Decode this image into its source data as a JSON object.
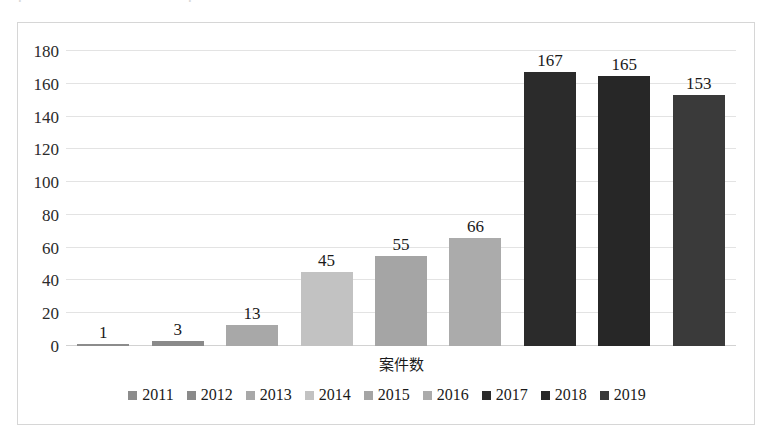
{
  "scan_artifact": {
    "text": "ー ． ・ ・ ・ ・ 一 ・ ・ ・ ・ ． ・ ・ ・ ・ ・"
  },
  "chart_data": {
    "type": "bar",
    "title": "",
    "subtitle": "",
    "xlabel": "案件数",
    "ylabel": "",
    "ylim": [
      0,
      180
    ],
    "ytick_step": 20,
    "yticks": [
      "180",
      "160",
      "140",
      "120",
      "100",
      "80",
      "60",
      "40",
      "20",
      "0"
    ],
    "grid": true,
    "legend_position": "bottom",
    "categories": [
      "2011",
      "2012",
      "2013",
      "2014",
      "2015",
      "2016",
      "2017",
      "2018",
      "2019"
    ],
    "values": [
      1,
      3,
      13,
      45,
      55,
      66,
      167,
      165,
      153
    ],
    "data_labels": [
      "1",
      "3",
      "13",
      "45",
      "55",
      "66",
      "167",
      "165",
      "153"
    ],
    "colors": [
      "#8c8c8c",
      "#8a8a8a",
      "#a8a8a8",
      "#c2c2c2",
      "#a5a5a5",
      "#ababab",
      "#2b2b2b",
      "#272727",
      "#3a3a3a"
    ],
    "series": [
      {
        "name": "2011",
        "value": 1,
        "color": "#8c8c8c"
      },
      {
        "name": "2012",
        "value": 3,
        "color": "#8a8a8a"
      },
      {
        "name": "2013",
        "value": 13,
        "color": "#a8a8a8"
      },
      {
        "name": "2014",
        "value": 45,
        "color": "#c2c2c2"
      },
      {
        "name": "2015",
        "value": 55,
        "color": "#a5a5a5"
      },
      {
        "name": "2016",
        "value": 66,
        "color": "#ababab"
      },
      {
        "name": "2017",
        "value": 167,
        "color": "#2b2b2b"
      },
      {
        "name": "2018",
        "value": 165,
        "color": "#272727"
      },
      {
        "name": "2019",
        "value": 153,
        "color": "#3a3a3a"
      }
    ]
  },
  "legend": {
    "items": [
      {
        "label": "2011",
        "color": "#8c8c8c"
      },
      {
        "label": "2012",
        "color": "#8a8a8a"
      },
      {
        "label": "2013",
        "color": "#a8a8a8"
      },
      {
        "label": "2014",
        "color": "#c2c2c2"
      },
      {
        "label": "2015",
        "color": "#a5a5a5"
      },
      {
        "label": "2016",
        "color": "#ababab"
      },
      {
        "label": "2017",
        "color": "#2b2b2b"
      },
      {
        "label": "2018",
        "color": "#272727"
      },
      {
        "label": "2019",
        "color": "#3a3a3a"
      }
    ]
  }
}
